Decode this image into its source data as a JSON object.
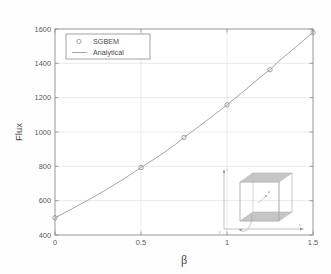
{
  "chart_data": {
    "type": "line",
    "title": "",
    "xlabel": "β",
    "ylabel": "Flux",
    "xlim": [
      0,
      1.5
    ],
    "ylim": [
      400,
      1600
    ],
    "xticks": [
      "0",
      "0.5",
      "1",
      "1.5"
    ],
    "xtick_values": [
      0,
      0.5,
      1,
      1.5
    ],
    "yticks": [
      "400",
      "600",
      "800",
      "1000",
      "1200",
      "1400",
      "1600"
    ],
    "ytick_values": [
      400,
      600,
      800,
      1000,
      1200,
      1400,
      1600
    ],
    "grid": true,
    "legend_position": "upper left",
    "series": [
      {
        "name": "SGBEM",
        "style": "markers",
        "marker": "circle-open",
        "x": [
          0,
          0.5,
          0.75,
          1.0,
          1.25,
          1.5
        ],
        "values": [
          500,
          793,
          968,
          1158,
          1363,
          1580
        ]
      },
      {
        "name": "Analytical",
        "style": "line",
        "x": [
          0,
          0.1,
          0.2,
          0.3,
          0.4,
          0.5,
          0.6,
          0.7,
          0.75,
          0.8,
          0.9,
          1.0,
          1.1,
          1.2,
          1.25,
          1.3,
          1.4,
          1.5
        ],
        "values": [
          500,
          553,
          608,
          665,
          727,
          793,
          857,
          928,
          968,
          1005,
          1080,
          1158,
          1240,
          1325,
          1363,
          1412,
          1495,
          1580
        ]
      }
    ]
  },
  "legend": {
    "entries": [
      {
        "label": "SGBEM",
        "marker": "circle-open"
      },
      {
        "label": "Analytical",
        "marker": "line"
      }
    ]
  },
  "inset": {
    "description": "3D cube with two shaded horizontal planes",
    "axis_labels": [
      "z",
      "y",
      "x"
    ],
    "point_label": "P",
    "arrow_label": "n"
  },
  "colors": {
    "curve": "#9a9a9a",
    "marker": "#8f8f8f",
    "axis": "#8c8c8c",
    "grid": "#dcdcdc",
    "text": "#4a4a4a",
    "inset_fill": "#b9b9b9",
    "inset_line": "#9c9c9c",
    "background": "#fefefe"
  }
}
